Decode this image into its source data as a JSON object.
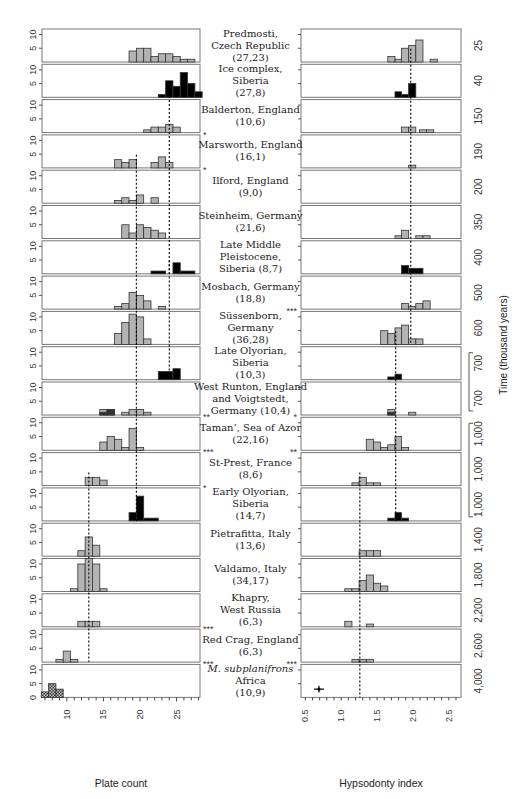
{
  "chart_data": {
    "type": "bar",
    "title": "",
    "left_panel": {
      "xlabel": "Plate count",
      "ylabel": "",
      "xlim": [
        6.6,
        28.2
      ],
      "ylim": [
        0,
        12
      ],
      "xticks": [
        10,
        15,
        20,
        25
      ],
      "yticks": [
        0,
        5,
        10
      ]
    },
    "right_panel": {
      "xlabel": "Hypsodonty index",
      "xlim": [
        0.44,
        2.67
      ],
      "xticks": [
        0.5,
        1.0,
        1.5,
        2.0,
        2.5
      ],
      "xtick_labels": [
        "0.5",
        "1.0",
        "1.5",
        "2.0",
        "2.5"
      ]
    },
    "time_axis_label": "Time (thousand years)",
    "legend": {
      "gray": "histogram (counts)",
      "black": "Siberian samples",
      "checkered": "M. subplanifrons"
    },
    "dashed_lines": {
      "left": [
        {
          "x": 24.0,
          "from_row": 1,
          "to_row": 6
        },
        {
          "x": 19.5,
          "from_row": 3,
          "to_row": 13
        },
        {
          "x": 24.0,
          "from_row": 6,
          "to_row": 9
        },
        {
          "x": 13.0,
          "from_row": 12,
          "to_row": 17
        }
      ],
      "right": [
        {
          "x": 1.97,
          "from_row": 0,
          "to_row": 8
        },
        {
          "x": 1.76,
          "from_row": 8,
          "to_row": 13
        },
        {
          "x": 1.26,
          "from_row": 12,
          "to_row": 18
        }
      ]
    },
    "rows": [
      {
        "site": [
          "Predmosti,",
          "Czech Republic",
          "(27,23)"
        ],
        "time": "25",
        "fill": "gray",
        "left": [
          [
            18.5,
            19.5,
            4
          ],
          [
            19.5,
            20.5,
            5
          ],
          [
            20.5,
            21.5,
            5
          ],
          [
            21.5,
            22.5,
            2
          ],
          [
            22.5,
            23.5,
            3
          ],
          [
            23.5,
            24.5,
            3
          ],
          [
            24.5,
            25.5,
            2
          ],
          [
            25.5,
            26.5,
            1
          ],
          [
            26.5,
            27.5,
            1
          ]
        ],
        "right": [
          [
            1.65,
            1.75,
            2
          ],
          [
            1.75,
            1.84,
            1
          ],
          [
            1.84,
            1.94,
            5
          ],
          [
            1.94,
            2.04,
            6
          ],
          [
            2.04,
            2.14,
            8
          ],
          [
            2.24,
            2.34,
            1
          ]
        ],
        "left_star": "",
        "right_star": ""
      },
      {
        "site": [
          "Ice complex,",
          "Siberia",
          "(27,8)"
        ],
        "time": "40",
        "fill": "black",
        "left": [
          [
            22.5,
            23.5,
            1
          ],
          [
            23.5,
            24.5,
            6
          ],
          [
            24.5,
            25.5,
            4
          ],
          [
            25.5,
            26.5,
            9
          ],
          [
            26.5,
            27.5,
            5
          ],
          [
            27.5,
            28.5,
            2
          ]
        ],
        "right": [
          [
            1.75,
            1.84,
            2
          ],
          [
            1.84,
            1.94,
            1
          ],
          [
            1.94,
            2.04,
            5
          ]
        ],
        "left_star": "",
        "right_star": ""
      },
      {
        "site": [
          "Balderton, England",
          "(10,6)"
        ],
        "time": "150",
        "fill": "gray",
        "left": [
          [
            20.5,
            21.5,
            1
          ],
          [
            21.5,
            22.5,
            2
          ],
          [
            22.5,
            23.5,
            2
          ],
          [
            23.5,
            24.5,
            3
          ],
          [
            24.5,
            25.5,
            2
          ]
        ],
        "right": [
          [
            1.84,
            1.94,
            2
          ],
          [
            1.94,
            2.04,
            2
          ],
          [
            2.09,
            2.19,
            1
          ],
          [
            2.19,
            2.29,
            1
          ]
        ],
        "left_star": "*",
        "right_star": ""
      },
      {
        "site": [
          "Marsworth, England",
          "(16,1)"
        ],
        "time": "190",
        "fill": "gray",
        "left": [
          [
            16.5,
            17.5,
            3
          ],
          [
            17.5,
            18.5,
            2
          ],
          [
            18.5,
            19.5,
            3
          ],
          [
            21.5,
            22.5,
            2
          ],
          [
            22.5,
            23.5,
            4
          ],
          [
            23.5,
            24.5,
            2
          ]
        ],
        "right": [
          [
            1.94,
            2.04,
            1
          ]
        ],
        "left_star": "*",
        "right_star": ""
      },
      {
        "site": [
          "Ilford, England",
          "(9,0)"
        ],
        "time": "200",
        "fill": "gray",
        "left": [
          [
            16.5,
            17.5,
            1
          ],
          [
            17.5,
            18.5,
            2
          ],
          [
            18.5,
            19.5,
            1
          ],
          [
            19.5,
            20.5,
            3
          ],
          [
            21.5,
            22.5,
            2
          ]
        ],
        "right": [],
        "left_star": "",
        "right_star": ""
      },
      {
        "site": [
          "Steinheim, Germany",
          "(21,6)"
        ],
        "time": "350",
        "fill": "gray",
        "left": [
          [
            17.5,
            18.5,
            5
          ],
          [
            18.5,
            19.5,
            2
          ],
          [
            19.5,
            20.5,
            5
          ],
          [
            20.5,
            21.5,
            4
          ],
          [
            21.5,
            22.5,
            3
          ],
          [
            22.5,
            23.5,
            2
          ]
        ],
        "right": [
          [
            1.75,
            1.84,
            1
          ],
          [
            1.84,
            1.94,
            3
          ],
          [
            2.04,
            2.14,
            1
          ],
          [
            2.14,
            2.24,
            1
          ]
        ],
        "left_star": "",
        "right_star": ""
      },
      {
        "site": [
          "Late Middle",
          "Pleistocene,",
          "Siberia (8,7)"
        ],
        "time": "400",
        "fill": "black",
        "left": [
          [
            21.5,
            23.5,
            1
          ],
          [
            24.5,
            25.5,
            4
          ],
          [
            25.5,
            27.5,
            1
          ]
        ],
        "right": [
          [
            1.84,
            1.94,
            3
          ],
          [
            1.94,
            2.14,
            2
          ]
        ],
        "left_star": "",
        "right_star": ""
      },
      {
        "site": [
          "Mosbach, Germany",
          "(18,8)"
        ],
        "time": "500",
        "fill": "gray",
        "left": [
          [
            16.5,
            17.5,
            1
          ],
          [
            17.5,
            18.5,
            2
          ],
          [
            18.5,
            19.5,
            6
          ],
          [
            19.5,
            20.5,
            5
          ],
          [
            20.5,
            21.5,
            3
          ],
          [
            22.5,
            23.5,
            1
          ]
        ],
        "right": [
          [
            1.84,
            1.94,
            2
          ],
          [
            1.94,
            2.04,
            1
          ],
          [
            2.04,
            2.14,
            2
          ],
          [
            2.14,
            2.24,
            3
          ]
        ],
        "left_star": "",
        "right_star": "***"
      },
      {
        "site": [
          "Süssenborn,",
          "Germany",
          "(36,28)"
        ],
        "time": "600",
        "fill": "gray",
        "left": [
          [
            16.5,
            17.5,
            4
          ],
          [
            17.5,
            18.5,
            8
          ],
          [
            18.5,
            19.5,
            11
          ],
          [
            19.5,
            20.5,
            10
          ],
          [
            20.5,
            21.5,
            2
          ]
        ],
        "right": [
          [
            1.55,
            1.65,
            5
          ],
          [
            1.65,
            1.75,
            4
          ],
          [
            1.75,
            1.84,
            6
          ],
          [
            1.84,
            1.94,
            7
          ],
          [
            1.94,
            2.04,
            2
          ],
          [
            2.04,
            2.14,
            2
          ]
        ],
        "left_star": "",
        "right_star": ""
      },
      {
        "site": [
          "Late Olyorian,",
          "Siberia",
          "(10,3)"
        ],
        "time": "700",
        "fill": "black",
        "left": [
          [
            22.5,
            24.5,
            3
          ],
          [
            24.5,
            25.5,
            4
          ]
        ],
        "right": [
          [
            1.65,
            1.75,
            1
          ],
          [
            1.75,
            1.84,
            2
          ]
        ],
        "left_star": "",
        "right_star": ""
      },
      {
        "site": [
          "West Runton, England",
          "and Voigtstedt,",
          "Germany (10,4)"
        ],
        "time": "700",
        "fill": "gray",
        "left": [
          [
            14.5,
            15.5,
            2
          ],
          [
            15.5,
            16.5,
            2
          ],
          [
            17.5,
            18.5,
            1
          ],
          [
            18.5,
            19.5,
            2
          ],
          [
            19.5,
            20.5,
            2
          ],
          [
            20.5,
            21.5,
            1
          ]
        ],
        "left_dark": [
          [
            14.5,
            15.5,
            1
          ],
          [
            15.5,
            16.5,
            2
          ]
        ],
        "right": [
          [
            1.65,
            1.75,
            2
          ],
          [
            1.94,
            2.04,
            1
          ]
        ],
        "right_dark": [
          [
            1.65,
            1.75,
            1
          ]
        ],
        "left_star": "**",
        "right_star": "*"
      },
      {
        "site": [
          "Taman’, Sea of Azor",
          "(22,16)"
        ],
        "time": "1,000",
        "fill": "gray",
        "left": [
          [
            14.5,
            15.5,
            3
          ],
          [
            15.5,
            16.5,
            5
          ],
          [
            16.5,
            17.5,
            4
          ],
          [
            17.5,
            18.5,
            1
          ],
          [
            18.5,
            19.5,
            8
          ],
          [
            19.5,
            20.5,
            1
          ]
        ],
        "right": [
          [
            1.35,
            1.45,
            4
          ],
          [
            1.45,
            1.55,
            3
          ],
          [
            1.55,
            1.65,
            1
          ],
          [
            1.65,
            1.75,
            2
          ],
          [
            1.75,
            1.84,
            5
          ],
          [
            1.84,
            1.94,
            1
          ]
        ],
        "left_star": "***",
        "right_star": "**"
      },
      {
        "site": [
          "St-Prest, France",
          "(8,6)"
        ],
        "time": "1,000",
        "fill": "gray",
        "left": [
          [
            12.5,
            13.5,
            3
          ],
          [
            13.5,
            14.5,
            3
          ],
          [
            14.5,
            15.5,
            2
          ]
        ],
        "right": [
          [
            1.15,
            1.25,
            1
          ],
          [
            1.25,
            1.35,
            3
          ],
          [
            1.35,
            1.45,
            1
          ],
          [
            1.45,
            1.55,
            1
          ]
        ],
        "left_star": "*",
        "right_star": ""
      },
      {
        "site": [
          "Early Olyorian,",
          "Siberia",
          "(14,7)"
        ],
        "time": "1,000",
        "fill": "black",
        "left": [
          [
            18.5,
            19.5,
            3
          ],
          [
            19.5,
            20.5,
            9
          ],
          [
            20.5,
            22.5,
            1
          ]
        ],
        "right": [
          [
            1.65,
            1.75,
            1
          ],
          [
            1.75,
            1.84,
            3
          ],
          [
            1.84,
            1.94,
            1
          ]
        ],
        "left_star": "",
        "right_star": ""
      },
      {
        "site": [
          "Pietrafitta, Italy",
          "(13,6)"
        ],
        "time": "1,400",
        "fill": "gray",
        "left": [
          [
            11.5,
            12.5,
            2
          ],
          [
            12.5,
            13.5,
            7
          ],
          [
            13.5,
            14.5,
            4
          ]
        ],
        "right": [
          [
            1.25,
            1.35,
            2
          ],
          [
            1.35,
            1.45,
            2
          ],
          [
            1.45,
            1.55,
            2
          ]
        ],
        "left_star": "",
        "right_star": ""
      },
      {
        "site": [
          "Valdamo, Italy",
          "(34,17)"
        ],
        "time": "1,800",
        "fill": "gray",
        "left": [
          [
            10.5,
            11.5,
            1
          ],
          [
            11.5,
            12.5,
            10
          ],
          [
            12.5,
            13.5,
            12
          ],
          [
            13.5,
            14.5,
            10
          ],
          [
            14.5,
            15.5,
            1
          ]
        ],
        "right": [
          [
            1.05,
            1.15,
            1
          ],
          [
            1.15,
            1.25,
            1
          ],
          [
            1.25,
            1.35,
            4
          ],
          [
            1.35,
            1.45,
            6
          ],
          [
            1.45,
            1.55,
            3
          ],
          [
            1.55,
            1.65,
            2
          ]
        ],
        "left_star": "",
        "right_star": ""
      },
      {
        "site": [
          "Khapry,",
          "West Russia",
          "(6,3)"
        ],
        "time": "2,200",
        "fill": "gray",
        "left": [
          [
            11.5,
            12.5,
            2
          ],
          [
            12.5,
            13.5,
            2
          ],
          [
            13.5,
            14.5,
            2
          ]
        ],
        "right": [
          [
            1.05,
            1.15,
            2
          ],
          [
            1.35,
            1.45,
            1
          ]
        ],
        "left_star": "***",
        "right_star": ""
      },
      {
        "site": [
          "Red Crag, England",
          "(6,3)"
        ],
        "time": "2,600",
        "fill": "gray",
        "left": [
          [
            8.5,
            9.5,
            1
          ],
          [
            9.5,
            10.5,
            4
          ],
          [
            10.5,
            11.5,
            1
          ]
        ],
        "right": [
          [
            1.15,
            1.25,
            1
          ],
          [
            1.25,
            1.35,
            1
          ],
          [
            1.35,
            1.45,
            1
          ]
        ],
        "left_star": "***",
        "right_star": "***"
      },
      {
        "site": [
          "M. subplanifrons",
          "Africa",
          "(10,9)"
        ],
        "time": "4,000",
        "fill": "checker",
        "left": [
          [
            6.5,
            7.5,
            2
          ],
          [
            7.5,
            8.5,
            5
          ],
          [
            8.5,
            9.5,
            3
          ]
        ],
        "right": [],
        "right_point": {
          "x": 0.69,
          "y": 3,
          "xerr": 0.07,
          "yerr": 1.2
        },
        "left_star": "",
        "right_star": ""
      }
    ]
  },
  "labels": {
    "left_xlabel": "Plate count",
    "right_xlabel": "Hypsodonty index",
    "time_axis": "Time (thousand years)"
  }
}
